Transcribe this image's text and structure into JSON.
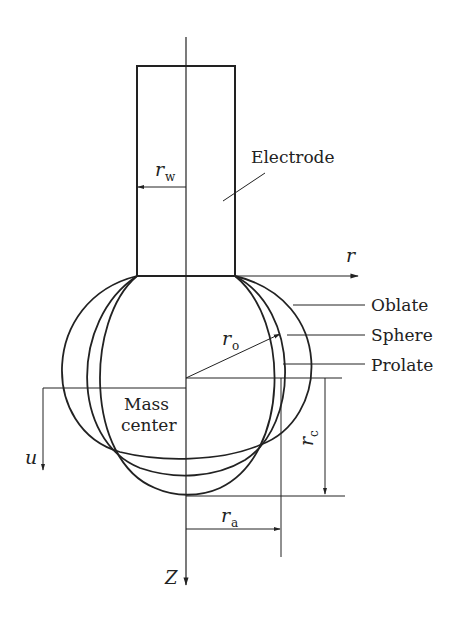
{
  "diagram": {
    "labels": {
      "electrode": "Electrode",
      "r_w": "r",
      "r_w_sub": "w",
      "r_axis": "r",
      "r_o": "r",
      "r_o_sub": "o",
      "oblate": "Oblate",
      "sphere": "Sphere",
      "prolate": "Prolate",
      "mass": "Mass",
      "center": "center",
      "u": "u",
      "r_c": "r",
      "r_c_sub": "c",
      "r_a": "r",
      "r_a_sub": "a",
      "z": "Z"
    },
    "shapes": [
      "Oblate",
      "Sphere",
      "Prolate"
    ],
    "colors": {
      "line": "#222222",
      "background": "#ffffff"
    }
  }
}
